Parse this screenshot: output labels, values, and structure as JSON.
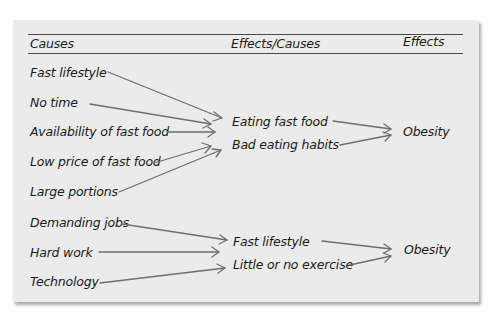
{
  "header": {
    "col_causes": "Causes",
    "col_effects_causes": "Effects/Causes",
    "col_effects": "Effects"
  },
  "group1": {
    "causes": [
      "Fast lifestyle",
      "No time",
      "Availability of fast food",
      "Low price of fast food",
      "Large portions"
    ],
    "effects_causes": [
      "Eating fast food",
      "Bad eating habits"
    ],
    "effect": "Obesity"
  },
  "group2": {
    "causes": [
      "Demanding jobs",
      "Hard work",
      "Technology"
    ],
    "effects_causes": [
      "Fast lifestyle",
      "Little or no exercise"
    ],
    "effect": "Obesity"
  },
  "colors": {
    "panel_background": "#ebebeb",
    "rule": "#4a4a4a",
    "arrow": "#6e6e6e",
    "text": "#1a1a1a"
  }
}
